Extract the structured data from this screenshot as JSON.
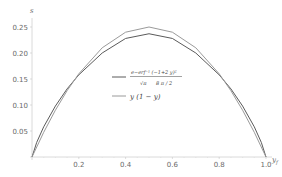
{
  "chart_data": {
    "type": "line",
    "title": "",
    "xlabel": "y",
    "ylabel": "s",
    "xlim": [
      0,
      1.0
    ],
    "ylim": [
      0,
      0.27
    ],
    "grid": false,
    "legend_position": "inside-center-right",
    "x_ticks": [
      "0.2",
      "0.4",
      "0.6",
      "0.8",
      "1.0"
    ],
    "y_ticks": [
      "0.05",
      "0.10",
      "0.15",
      "0.20",
      "0.25"
    ],
    "series": [
      {
        "name": "e^(-erf^-1(-1+2y)^2) / (sqrt(pi) * cbrt(8pi/2))",
        "legend_numerator": "e−erf⁻¹ (−1+2 y)²",
        "legend_denominator_left": "√π",
        "legend_denominator_right": "8 π / 2",
        "color": "#5a5a5a",
        "x": [
          0,
          0.02,
          0.05,
          0.1,
          0.15,
          0.2,
          0.3,
          0.4,
          0.5,
          0.6,
          0.7,
          0.8,
          0.85,
          0.9,
          0.95,
          0.98,
          1.0
        ],
        "values": [
          0,
          0.028,
          0.058,
          0.098,
          0.131,
          0.158,
          0.2,
          0.228,
          0.237,
          0.228,
          0.2,
          0.158,
          0.131,
          0.098,
          0.058,
          0.028,
          0
        ]
      },
      {
        "name": "y (1 − y)",
        "legend_label": "y (1 − y)",
        "color": "#9a9a9a",
        "x": [
          0,
          0.05,
          0.1,
          0.15,
          0.2,
          0.3,
          0.4,
          0.5,
          0.6,
          0.7,
          0.8,
          0.85,
          0.9,
          0.95,
          1.0
        ],
        "values": [
          0,
          0.0475,
          0.09,
          0.1275,
          0.16,
          0.21,
          0.24,
          0.25,
          0.24,
          0.21,
          0.16,
          0.1275,
          0.09,
          0.0475,
          0
        ]
      }
    ]
  },
  "axes": {
    "x_label": "y",
    "x_label_sub": "f",
    "y_label": "s"
  }
}
